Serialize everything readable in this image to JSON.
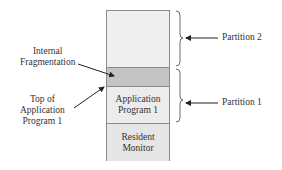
{
  "memory": {
    "segments": [
      {
        "id": "partition2-free",
        "label": ""
      },
      {
        "id": "internal-fragmentation",
        "label": ""
      },
      {
        "id": "application-program-1",
        "label": "Application Program 1"
      },
      {
        "id": "resident-monitor",
        "label": "Resident Monitor"
      }
    ]
  },
  "labels": {
    "internal_fragmentation_line1": "Internal",
    "internal_fragmentation_line2": "Fragmentation",
    "top_of_app_line1": "Top of",
    "top_of_app_line2": "Application",
    "top_of_app_line3": "Program 1",
    "partition2": "Partition 2",
    "partition1": "Partition 1",
    "app_line1": "Application",
    "app_line2": "Program 1",
    "rm_line1": "Resident",
    "rm_line2": "Monitor"
  },
  "colors": {
    "free": "#efefef",
    "fragmentation": "#c4c4c4",
    "app": "#ececec",
    "monitor": "#e6e6e6",
    "border": "#8a8a8a"
  }
}
